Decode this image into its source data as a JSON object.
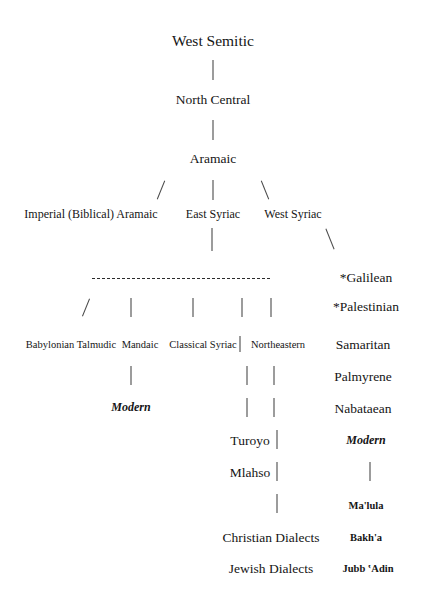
{
  "diagram": {
    "title_text": "West Semitic",
    "type": "language-family-tree",
    "background": "#ffffff",
    "text_color": "#151515",
    "line_color": "#3b3b3b",
    "nodes": {
      "west_semitic": "West Semitic",
      "north_central": "North Central",
      "aramaic": "Aramaic",
      "imperial_biblical_aramaic": "Imperial (Biblical) Aramaic",
      "east_syriac": "East Syriac",
      "west_syriac": "West Syriac",
      "galilean": "*Galilean",
      "palestinian": "*Palestinian",
      "babylonian_talmudic": "Babylonian Talmudic",
      "mandaic": "Mandaic",
      "classical_syriac": "Classical Syriac",
      "northeastern": "Northeastern",
      "samaritan": "Samaritan",
      "palmyrene": "Palmyrene",
      "modern_left": "Modern",
      "nabataean": "Nabataean",
      "turoyo": "Turoyo",
      "modern_right": "Modern",
      "mlahso": "Mlahso",
      "malula": "Ma'lula",
      "christian_dialects": "Christian Dialects",
      "bakha": "Bakh'a",
      "jewish_dialects": "Jewish Dialects",
      "jubb_adin": "Jubb ʽAdin"
    }
  }
}
